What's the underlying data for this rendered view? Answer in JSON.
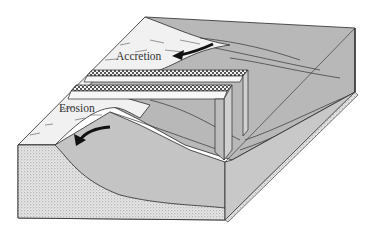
{
  "diagram": {
    "type": "block-diagram",
    "labels": {
      "accretion": "Accretion",
      "erosion": "Erosion"
    },
    "colors": {
      "water": "#b4b4b4",
      "sand_light": "#f2f2f2",
      "stipple": "#d8d8d8",
      "line": "#2a2a2a"
    }
  }
}
